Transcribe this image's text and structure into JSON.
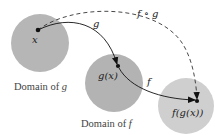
{
  "diagram": {
    "type": "function-composition",
    "colors": {
      "domain_g_fill": "#b6b6b6",
      "domain_f_fill": "#b3b3b3",
      "range_fill": "#cfcfcf",
      "arrow": "#111111",
      "text": "#333333"
    },
    "nodes": {
      "x": {
        "label": "x"
      },
      "gx": {
        "label": "g(x)"
      },
      "fgx": {
        "label": "f(g(x))"
      }
    },
    "regions": {
      "domain_g": {
        "caption_prefix": "Domain of ",
        "caption_var": "g"
      },
      "domain_f": {
        "caption_prefix": "Domain of ",
        "caption_var": "f"
      },
      "range": {
        "caption": ""
      }
    },
    "arrows": {
      "g": {
        "label": "g",
        "style": "solid",
        "from": "x",
        "to": "g(x)"
      },
      "f": {
        "label": "f",
        "style": "solid",
        "from": "g(x)",
        "to": "f(g(x))"
      },
      "fog": {
        "label": "f ∘ g",
        "style": "dashed",
        "from": "x",
        "to": "f(g(x))"
      }
    }
  }
}
